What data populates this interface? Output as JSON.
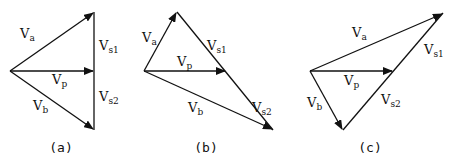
{
  "diagrams": [
    {
      "id": "a",
      "caption": "(a)",
      "labels": {
        "va": "a",
        "vb": "b",
        "vp": "p",
        "vs1": "s1",
        "vs2": "s2"
      }
    },
    {
      "id": "b",
      "caption": "(b)",
      "labels": {
        "va": "a",
        "vb": "b",
        "vp": "p",
        "vs1": "s1",
        "vs2": "s2"
      }
    },
    {
      "id": "c",
      "caption": "(c)",
      "labels": {
        "va": "a",
        "vb": "b",
        "vp": "p",
        "vs1": "s1",
        "vs2": "s2"
      }
    }
  ],
  "symbol": "V"
}
